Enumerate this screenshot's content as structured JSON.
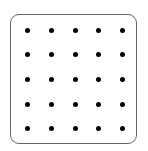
{
  "grid": {
    "rows": 5,
    "cols": 5,
    "dot_color": "#000000",
    "border_color": "#666666",
    "x_centers": [
      27,
      51,
      75,
      98,
      122
    ],
    "y_centers": [
      30,
      54,
      79,
      104,
      128
    ]
  }
}
